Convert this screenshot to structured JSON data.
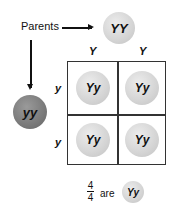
{
  "labels": {
    "parents": "Parents"
  },
  "parents": {
    "top": {
      "genotype": "YY",
      "shade": "light"
    },
    "left": {
      "genotype": "yy",
      "shade": "dark"
    }
  },
  "alleles": {
    "columns": [
      "Y",
      "Y"
    ],
    "rows": [
      "y",
      "y"
    ]
  },
  "cells": [
    [
      "Yy",
      "Yy"
    ],
    [
      "Yy",
      "Yy"
    ]
  ],
  "result": {
    "numerator": "4",
    "denominator": "4",
    "word": "are",
    "genotype": "Yy"
  },
  "colors": {
    "light_ball": "#d4d4d4",
    "dark_ball": "#7a7a7a",
    "grid_line": "#333333"
  }
}
